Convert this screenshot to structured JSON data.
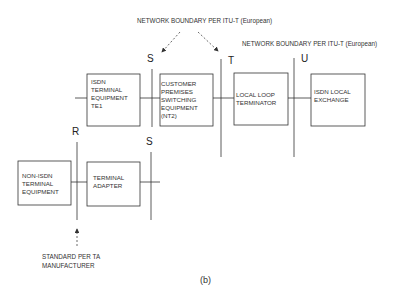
{
  "annotations": {
    "top_boundary": "NETWORK BOUNDARY PER  ITU-T (European)",
    "right_boundary": "NETWORK BOUNDARY PER  ITU-T (European)",
    "standard_note_line1": "STANDARD PER  TA",
    "standard_note_line2": "MANUFACTURER"
  },
  "reference_points": {
    "s_top": "S",
    "t": "T",
    "u": "U",
    "r": "R",
    "s_bottom": "S"
  },
  "boxes": {
    "te1": "ISDN\nTERMINAL\nEQUIPMENT\nTE1",
    "nt2": "CUSTOMER\nPREMISES\nSWITCHING\nEQUIPMENT\n(NT2)",
    "nt1": "LOCAL LOOP\nTERMINATOR",
    "exchange": "ISDN LOCAL\nEXCHANGE",
    "te2": "NON-ISDN\nTERMINAL\nEQUIPMENT",
    "ta": "TERMINAL\nADAPTER"
  },
  "caption": "(b)",
  "colors": {
    "line": "#333333",
    "arrow": "#444444"
  }
}
